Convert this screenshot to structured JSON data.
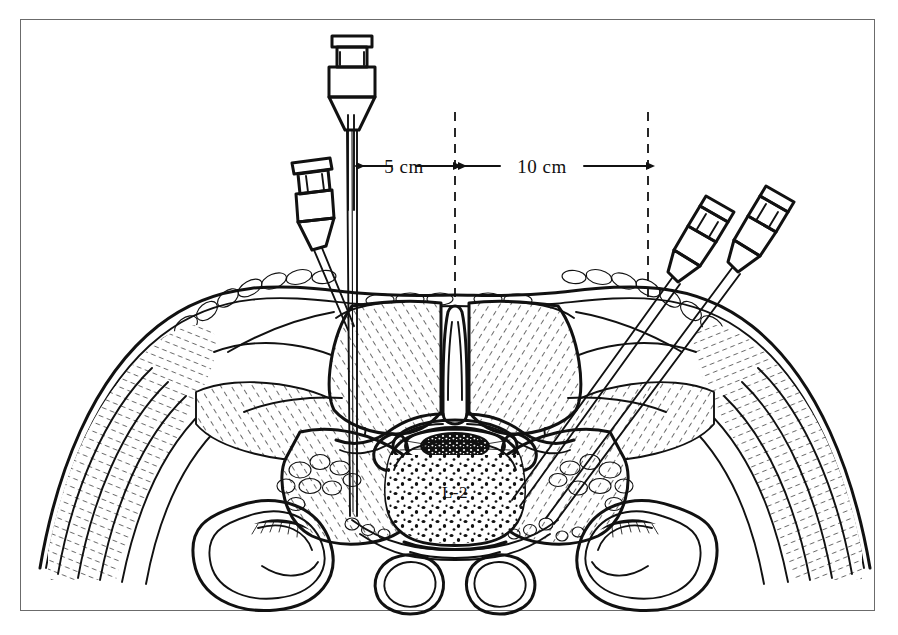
{
  "figure": {
    "type": "medical-line-illustration",
    "background_color": "#ffffff",
    "ink_color": "#111111",
    "frame": {
      "present": true,
      "color": "#6b6b6b",
      "style": "thin-rectangle"
    }
  },
  "labels": {
    "vertebra": "L-2"
  },
  "dimensions": [
    {
      "id": "dim-5cm",
      "label": "5 cm",
      "from": "paramedian-needle-entry",
      "to": "midline",
      "arrow_style": "double-headed"
    },
    {
      "id": "dim-10cm",
      "label": "10 cm",
      "from": "midline",
      "to": "lateral-oblique-entry",
      "arrow_style": "double-headed"
    }
  ],
  "reference_lines": [
    {
      "id": "midline-reference",
      "style": "dashed",
      "orientation": "vertical"
    },
    {
      "id": "lateral-reference",
      "style": "dashed",
      "orientation": "vertical"
    }
  ],
  "needles": [
    {
      "id": "needle-paramedian-vertical",
      "side": "left",
      "orientation": "vertical",
      "hub": "visible"
    },
    {
      "id": "needle-left-oblique",
      "side": "left",
      "orientation": "oblique",
      "hub": "visible"
    },
    {
      "id": "needle-right-oblique-inner",
      "side": "right",
      "orientation": "oblique",
      "hub": "visible"
    },
    {
      "id": "needle-right-oblique-outer",
      "side": "right",
      "orientation": "oblique",
      "hub": "visible"
    }
  ],
  "anatomy": [
    "skin-and-subcutaneous-fat",
    "erector-spinae-muscle",
    "spinous-process",
    "lamina",
    "transverse-process",
    "vertebral-body-L2",
    "spinal-canal-cauda-equina",
    "psoas-muscle",
    "quadratus-lumborum",
    "kidney-left",
    "kidney-right",
    "aorta",
    "inferior-vena-cava",
    "retroperitoneal-fat"
  ]
}
